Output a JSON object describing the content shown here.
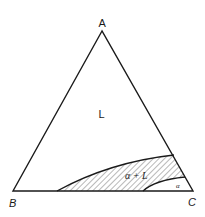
{
  "diagram": {
    "type": "ternary-phase-diagram",
    "vertices": {
      "top": "A",
      "bottom_left": "B",
      "bottom_right": "C"
    },
    "regions": {
      "liquid": "L",
      "two_phase": "α + L",
      "solid": "α"
    },
    "colors": {
      "line": "#1a1a1a",
      "background": "#ffffff",
      "hatch": "#333333"
    }
  }
}
